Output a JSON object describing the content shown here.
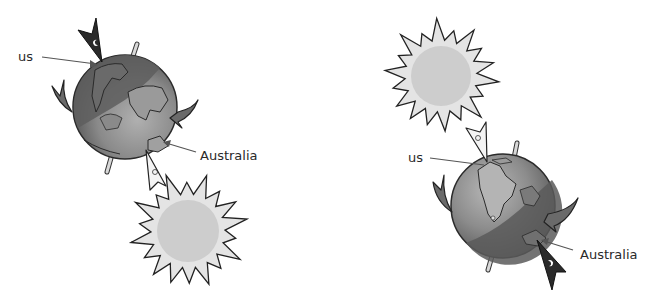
{
  "diagram": {
    "type": "earth-rotation-sun-position",
    "panels": [
      {
        "id": "left",
        "description": "Sun below Earth: daytime in Australia, night for us",
        "labels": {
          "us": "us",
          "australia": "Australia"
        },
        "sun_position": "bottom-right",
        "us_marker": "dark-moon-pointer",
        "australia_marker": "light-sun-pointer"
      },
      {
        "id": "right",
        "description": "Sun above Earth: daytime for us, night in Australia",
        "labels": {
          "us": "us",
          "australia": "Australia"
        },
        "sun_position": "top-left",
        "us_marker": "light-sun-pointer",
        "australia_marker": "dark-moon-pointer"
      }
    ],
    "colors": {
      "globe_dark": "#5a5a5a",
      "globe_light": "#a8a8a8",
      "sun_rays": "#e6e6e6",
      "sun_disk": "#cfcfcf",
      "outline": "#222222",
      "label_text": "#2a2a2a",
      "arrow_line": "#555555"
    }
  }
}
